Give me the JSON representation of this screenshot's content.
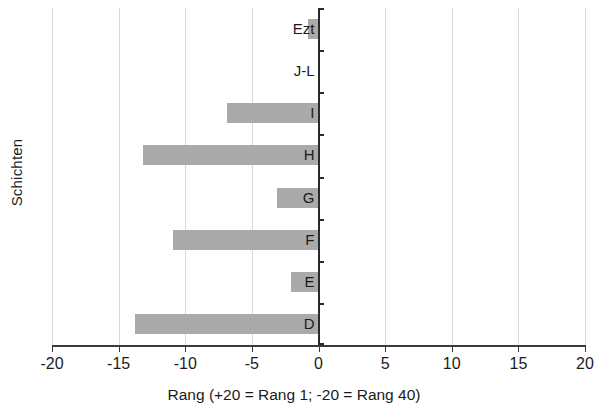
{
  "chart_data": {
    "type": "bar",
    "orientation": "horizontal",
    "title": "",
    "xlabel": "Rang (+20 = Rang 1; -20 = Rang 40)",
    "ylabel": "Schichten",
    "categories": [
      "D",
      "E",
      "F",
      "G",
      "H",
      "I",
      "J-L",
      "Ezt"
    ],
    "values": [
      -13.8,
      -2.1,
      -10.9,
      -3.1,
      -13.2,
      -6.9,
      0,
      -0.8
    ],
    "xlim": [
      -20,
      20
    ],
    "xticks": [
      -20,
      -15,
      -10,
      -5,
      0,
      5,
      10,
      15,
      20
    ],
    "xticklabels": [
      "-20",
      "-15",
      "-10",
      "-5",
      "0",
      "5",
      "10",
      "15",
      "20"
    ],
    "grid": "vertical",
    "legend": "none",
    "bar_color": "#aaaaaa",
    "axis_color": "#2a2a2a",
    "gridline_color": "#d9d9d9"
  }
}
